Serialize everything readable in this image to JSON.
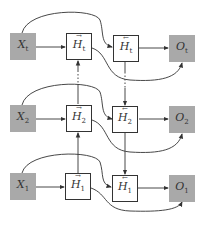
{
  "diagram": {
    "type": "bidirectional-rnn",
    "colors": {
      "io_fill": "#a9a9a9",
      "hidden_border": "#333333",
      "line": "#333333"
    },
    "rows": [
      {
        "id": "t",
        "input": {
          "base": "X",
          "sub": "t"
        },
        "forward": {
          "base": "H",
          "sub": "t",
          "arrow": "→"
        },
        "backward": {
          "base": "H",
          "sub": "t",
          "arrow": "←"
        },
        "output": {
          "base": "O",
          "sub": "t"
        }
      },
      {
        "id": "2",
        "input": {
          "base": "X",
          "sub": "2"
        },
        "forward": {
          "base": "H",
          "sub": "2",
          "arrow": "→"
        },
        "backward": {
          "base": "H",
          "sub": "2",
          "arrow": "←"
        },
        "output": {
          "base": "O",
          "sub": "2"
        }
      },
      {
        "id": "1",
        "input": {
          "base": "X",
          "sub": "1"
        },
        "forward": {
          "base": "H",
          "sub": "1",
          "arrow": "→"
        },
        "backward": {
          "base": "H",
          "sub": "1",
          "arrow": "←"
        },
        "output": {
          "base": "O",
          "sub": "1"
        }
      }
    ]
  }
}
